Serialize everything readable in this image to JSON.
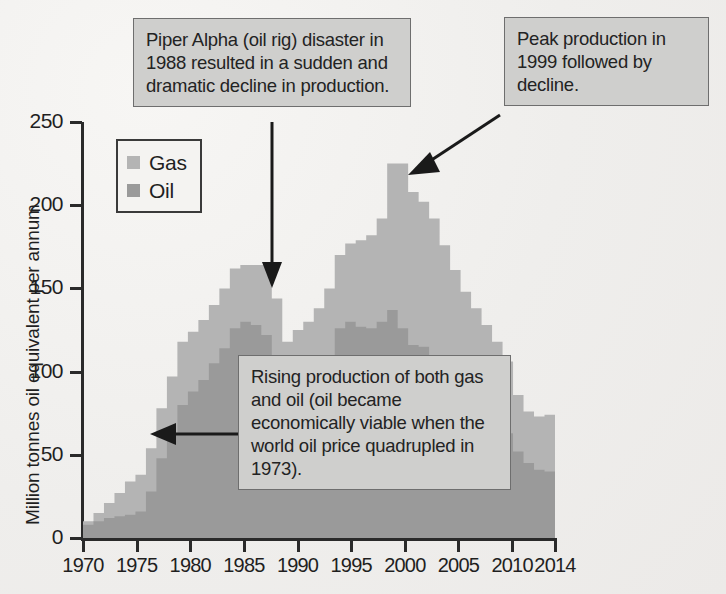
{
  "chart_data": {
    "type": "area",
    "stacked": true,
    "title": "",
    "xlabel": "",
    "ylabel": "Million tonnes oil equivalent per annum",
    "xlim": [
      1970,
      2014
    ],
    "ylim": [
      0,
      250
    ],
    "grid": false,
    "legend_position": "inside-top-left",
    "ytick_labels": [
      "0",
      "50",
      "100",
      "150",
      "200",
      "250"
    ],
    "yticks": [
      0,
      50,
      100,
      150,
      200,
      250
    ],
    "xtick_labels": [
      "1970",
      "1975",
      "1980",
      "1985",
      "1990",
      "1995",
      "2000",
      "2005",
      "2010",
      "2014"
    ],
    "xticks": [
      1970,
      1975,
      1980,
      1985,
      1990,
      1995,
      2000,
      2005,
      2010,
      2014
    ],
    "x": [
      1970,
      1971,
      1972,
      1973,
      1974,
      1975,
      1976,
      1977,
      1978,
      1979,
      1980,
      1981,
      1982,
      1983,
      1984,
      1985,
      1986,
      1987,
      1988,
      1989,
      1990,
      1991,
      1992,
      1993,
      1994,
      1995,
      1996,
      1997,
      1998,
      1999,
      2000,
      2001,
      2002,
      2003,
      2004,
      2005,
      2006,
      2007,
      2008,
      2009,
      2010,
      2011,
      2012,
      2013,
      2014
    ],
    "series": [
      {
        "name": "Oil",
        "color": "#9a9a9a",
        "values": [
          8,
          10,
          12,
          13,
          14,
          16,
          28,
          48,
          63,
          80,
          88,
          95,
          105,
          114,
          126,
          130,
          128,
          122,
          110,
          90,
          92,
          92,
          96,
          104,
          126,
          130,
          127,
          126,
          130,
          137,
          126,
          116,
          115,
          106,
          95,
          85,
          77,
          76,
          72,
          68,
          63,
          52,
          45,
          41,
          40
        ]
      },
      {
        "name": "Gas",
        "color": "#b4b4b4",
        "values": [
          2,
          5,
          9,
          14,
          20,
          22,
          26,
          30,
          34,
          38,
          36,
          36,
          35,
          36,
          36,
          34,
          36,
          42,
          34,
          28,
          33,
          38,
          42,
          46,
          44,
          47,
          52,
          56,
          62,
          88,
          99,
          92,
          87,
          86,
          81,
          76,
          71,
          62,
          56,
          50,
          43,
          34,
          31,
          32,
          34
        ]
      }
    ],
    "totals": [
      10,
      15,
      21,
      27,
      34,
      38,
      54,
      78,
      97,
      118,
      124,
      131,
      140,
      150,
      162,
      164,
      164,
      164,
      144,
      118,
      125,
      130,
      138,
      150,
      170,
      177,
      179,
      182,
      192,
      225,
      225,
      208,
      202,
      192,
      176,
      161,
      148,
      138,
      128,
      118,
      106,
      86,
      76,
      73,
      74
    ],
    "peak": {
      "year": 1999,
      "value": 225
    }
  },
  "legend": {
    "items": [
      {
        "label": "Gas",
        "color": "#b4b4b4"
      },
      {
        "label": "Oil",
        "color": "#9a9a9a"
      }
    ]
  },
  "callouts": {
    "piper": "Piper Alpha (oil rig) disaster in 1988 resulted in a sudden and dramatic decline in production.",
    "peak": "Peak production in 1999 followed by decline.",
    "rising": "Rising production of both gas and oil (oil became economically viable when the world oil price quadrupled in 1973)."
  },
  "axes": {
    "y_title": "Million tonnes oil equivalent per annum"
  },
  "colors": {
    "gas": "#b4b4b4",
    "oil": "#9a9a9a",
    "axis": "#2a2a2a",
    "callout_bg": "#cfcfcd",
    "callout_border": "#6e6e6e",
    "page_bg": "#f2f1ef"
  }
}
